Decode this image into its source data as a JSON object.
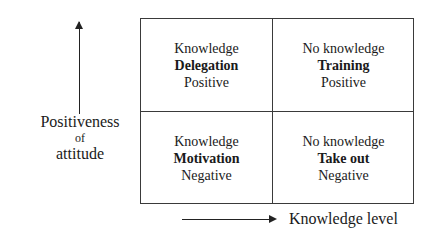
{
  "y_axis": {
    "label_line1": "Positiveness",
    "label_line2": "of",
    "label_line3": "attitude",
    "arrow": "arrow-up"
  },
  "x_axis": {
    "label": "Knowledge level",
    "arrow": "arrow-right"
  },
  "quadrants": [
    {
      "position": "top-left",
      "knowledge": "Knowledge",
      "action": "Delegation",
      "attitude": "Positive"
    },
    {
      "position": "top-right",
      "knowledge": "No knowledge",
      "action": "Training",
      "attitude": "Positive"
    },
    {
      "position": "bottom-left",
      "knowledge": "Knowledge",
      "action": "Motivation",
      "attitude": "Negative"
    },
    {
      "position": "bottom-right",
      "knowledge": "No knowledge",
      "action": "Take out",
      "attitude": "Negative"
    }
  ]
}
